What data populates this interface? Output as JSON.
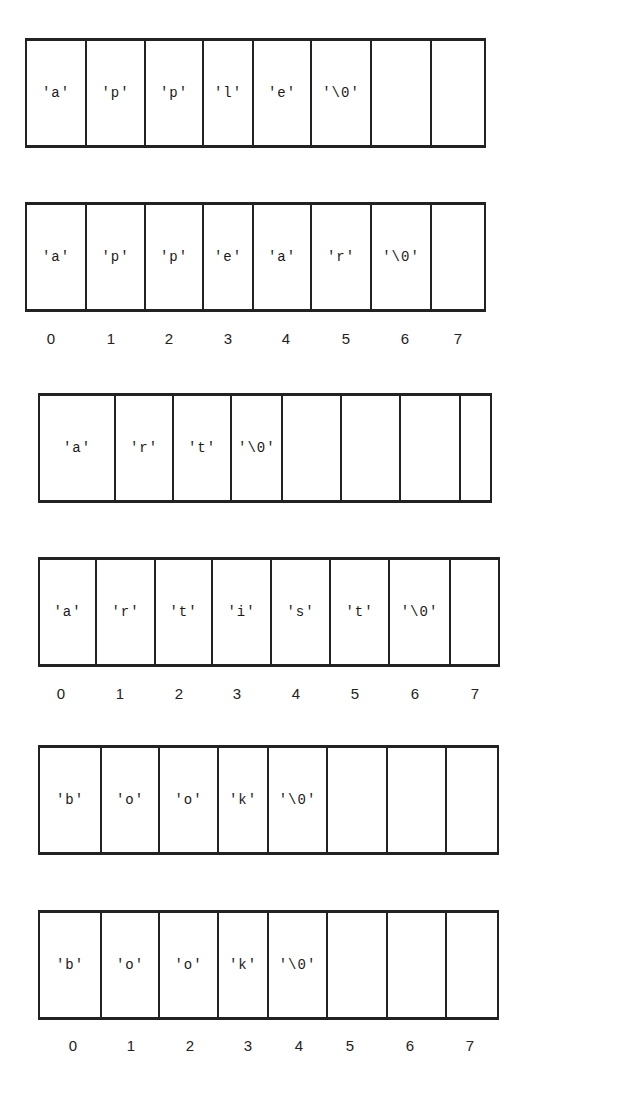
{
  "diagram": {
    "title": "",
    "arrays": [
      {
        "id": "array-apple",
        "cells": [
          "'a'",
          "'p'",
          "'p'",
          "'l'",
          "'e'",
          "'\\0'",
          "",
          ""
        ]
      },
      {
        "id": "array-appear",
        "cells": [
          "'a'",
          "'p'",
          "'p'",
          "'e'",
          "'a'",
          "'r'",
          "'\\0'",
          ""
        ]
      },
      {
        "id": "array-art",
        "cells": [
          "'a'",
          "'r'",
          "'t'",
          "'\\0'",
          "",
          "",
          "",
          ""
        ]
      },
      {
        "id": "array-artist",
        "cells": [
          "'a'",
          "'r'",
          "'t'",
          "'i'",
          "'s'",
          "'t'",
          "'\\0'",
          ""
        ]
      },
      {
        "id": "array-book-1",
        "cells": [
          "'b'",
          "'o'",
          "'o'",
          "'k'",
          "'\\0'",
          "",
          "",
          ""
        ]
      },
      {
        "id": "array-book-2",
        "cells": [
          "'b'",
          "'o'",
          "'o'",
          "'k'",
          "'\\0'",
          "",
          "",
          ""
        ]
      }
    ],
    "index_labels": [
      "0",
      "1",
      "2",
      "3",
      "4",
      "5",
      "6",
      "7"
    ]
  }
}
